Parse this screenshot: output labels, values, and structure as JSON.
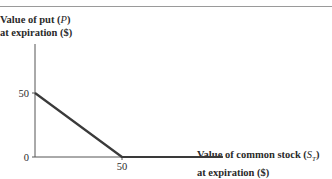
{
  "chart_data": {
    "type": "line",
    "title": "",
    "ylabel_line1": "Value of put (",
    "ylabel_var": "P",
    "ylabel_line1_end": ")",
    "ylabel_line2": "at expiration ($)",
    "xlabel_line1": "Value of common stock (",
    "xlabel_var": "S",
    "xlabel_sub": "T",
    "xlabel_line1_end": ")",
    "xlabel_line2": "at expiration ($)",
    "xlim": [
      0,
      110
    ],
    "ylim": [
      0,
      88
    ],
    "xticks": [
      {
        "value": 50,
        "label": "50"
      }
    ],
    "yticks": [
      {
        "value": 0,
        "label": "0"
      },
      {
        "value": 50,
        "label": "50"
      }
    ],
    "grid": false,
    "series": [
      {
        "name": "Put payoff",
        "color": "#3a3a3a",
        "x": [
          0,
          50,
          108
        ],
        "y": [
          50,
          0,
          0
        ]
      }
    ]
  }
}
